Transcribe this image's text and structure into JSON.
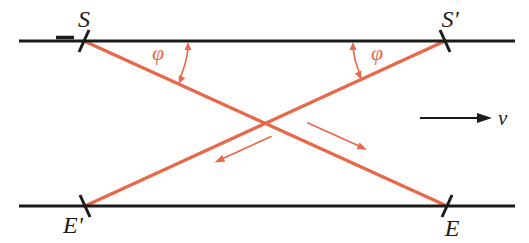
{
  "figure": {
    "labels": {
      "source_top_left": "S",
      "source_top_right": "S'",
      "event_bottom_left": "E'",
      "event_bottom_right": "E",
      "angle_left": "φ",
      "angle_right": "φ",
      "velocity": "v"
    },
    "colors": {
      "line": "#1b1b1b",
      "ray": "#e8684a",
      "background": "#ffffff"
    }
  }
}
